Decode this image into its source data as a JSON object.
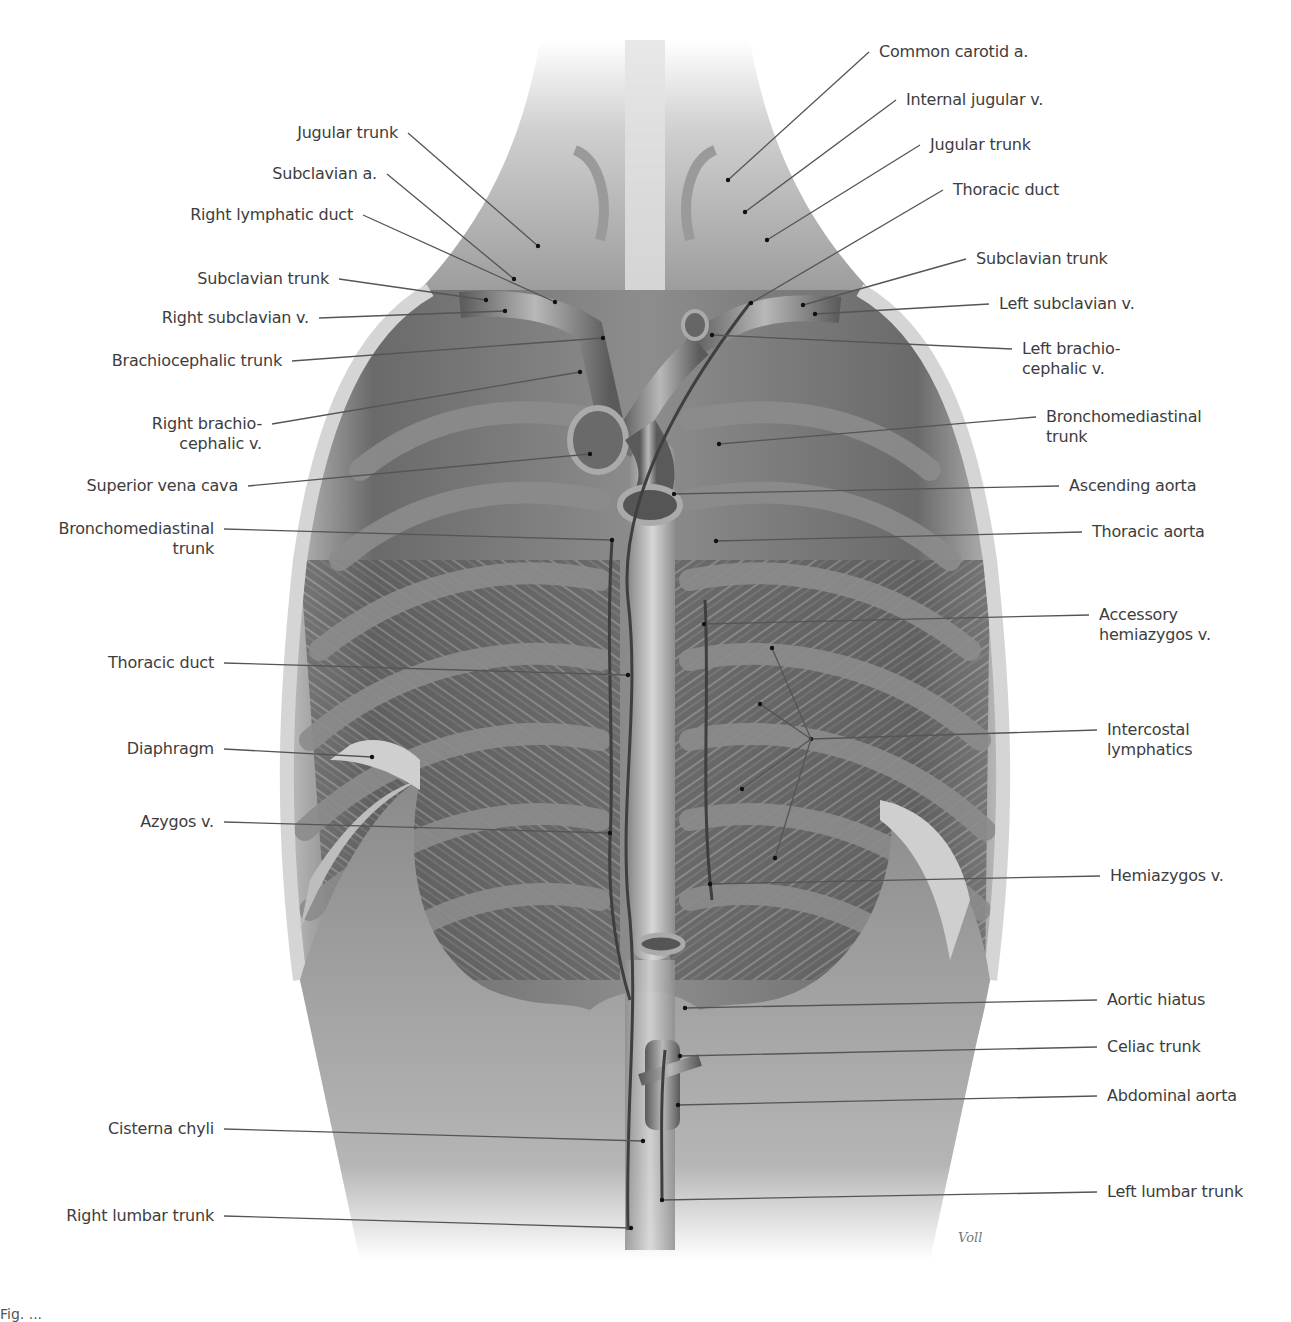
{
  "figure": {
    "signature": "Voll",
    "caption_partial": "Fig. ..."
  },
  "colors": {
    "background": "#ffffff",
    "label_text": "#3d3d3d",
    "leader_line": "#555555",
    "tissue_dark": "#4a4a4a",
    "tissue_mid": "#8a8a8a",
    "tissue_light": "#c8c8c8"
  },
  "labels_left": [
    {
      "id": "jugular-trunk-right",
      "text": "Jugular trunk",
      "x": 398,
      "y": 133,
      "anchor": "end",
      "tx": 538,
      "ty": 246
    },
    {
      "id": "subclavian-a",
      "text": "Subclavian a.",
      "x": 377,
      "y": 174,
      "anchor": "end",
      "tx": 514,
      "ty": 279
    },
    {
      "id": "right-lymphatic-duct",
      "text": "Right lymphatic duct",
      "x": 353,
      "y": 215,
      "anchor": "end",
      "tx": 555,
      "ty": 302
    },
    {
      "id": "subclavian-trunk-right",
      "text": "Subclavian trunk",
      "x": 329,
      "y": 279,
      "anchor": "end",
      "tx": 486,
      "ty": 300
    },
    {
      "id": "right-subclavian-v",
      "text": "Right subclavian v.",
      "x": 309,
      "y": 318,
      "anchor": "end",
      "tx": 505,
      "ty": 311
    },
    {
      "id": "brachiocephalic-trunk",
      "text": "Brachiocephalic trunk",
      "x": 282,
      "y": 361,
      "anchor": "end",
      "tx": 603,
      "ty": 338
    },
    {
      "id": "right-brachiocephalic-v",
      "text": "Right brachio-\ncephalic v.",
      "x": 262,
      "y": 424,
      "anchor": "end",
      "tx": 580,
      "ty": 372
    },
    {
      "id": "superior-vena-cava",
      "text": "Superior vena cava",
      "x": 238,
      "y": 486,
      "anchor": "end",
      "tx": 590,
      "ty": 454
    },
    {
      "id": "bronchomediastinal-trunk-right",
      "text": "Bronchomediastinal\ntrunk",
      "x": 214,
      "y": 529,
      "anchor": "end",
      "tx": 612,
      "ty": 540
    },
    {
      "id": "thoracic-duct-left-side",
      "text": "Thoracic duct",
      "x": 214,
      "y": 663,
      "anchor": "end",
      "tx": 628,
      "ty": 675
    },
    {
      "id": "diaphragm",
      "text": "Diaphragm",
      "x": 214,
      "y": 749,
      "anchor": "end",
      "tx": 372,
      "ty": 757
    },
    {
      "id": "azygos-v",
      "text": "Azygos v.",
      "x": 214,
      "y": 822,
      "anchor": "end",
      "tx": 610,
      "ty": 833
    },
    {
      "id": "cisterna-chyli",
      "text": "Cisterna chyli",
      "x": 214,
      "y": 1129,
      "anchor": "end",
      "tx": 643,
      "ty": 1141
    },
    {
      "id": "right-lumbar-trunk",
      "text": "Right lumbar trunk",
      "x": 214,
      "y": 1216,
      "anchor": "end",
      "tx": 631,
      "ty": 1228
    }
  ],
  "labels_right": [
    {
      "id": "common-carotid-a",
      "text": "Common carotid a.",
      "x": 879,
      "y": 52,
      "tx": 728,
      "ty": 180
    },
    {
      "id": "internal-jugular-v",
      "text": "Internal jugular v.",
      "x": 906,
      "y": 100,
      "tx": 745,
      "ty": 212
    },
    {
      "id": "jugular-trunk-left",
      "text": "Jugular trunk",
      "x": 930,
      "y": 145,
      "tx": 767,
      "ty": 240
    },
    {
      "id": "thoracic-duct-top",
      "text": "Thoracic duct",
      "x": 953,
      "y": 190,
      "tx": 751,
      "ty": 303
    },
    {
      "id": "subclavian-trunk-left",
      "text": "Subclavian trunk",
      "x": 976,
      "y": 259,
      "tx": 803,
      "ty": 305
    },
    {
      "id": "left-subclavian-v",
      "text": "Left subclavian v.",
      "x": 999,
      "y": 304,
      "tx": 815,
      "ty": 314
    },
    {
      "id": "left-brachiocephalic-v",
      "text": "Left brachio-\ncephalic v.",
      "x": 1022,
      "y": 349,
      "tx": 712,
      "ty": 335
    },
    {
      "id": "bronchomediastinal-trunk-left",
      "text": "Bronchomediastinal\ntrunk",
      "x": 1046,
      "y": 417,
      "tx": 719,
      "ty": 444
    },
    {
      "id": "ascending-aorta",
      "text": "Ascending aorta",
      "x": 1069,
      "y": 486,
      "tx": 674,
      "ty": 494
    },
    {
      "id": "thoracic-aorta",
      "text": "Thoracic aorta",
      "x": 1092,
      "y": 532,
      "tx": 716,
      "ty": 541
    },
    {
      "id": "accessory-hemiazygos-v",
      "text": "Accessory\nhemiazygos v.",
      "x": 1099,
      "y": 615,
      "tx": 704,
      "ty": 624
    },
    {
      "id": "intercostal-lymphatics",
      "text": "Intercostal\nlymphatics",
      "x": 1107,
      "y": 730,
      "tx": 811,
      "ty": 739
    },
    {
      "id": "hemiazygos-v",
      "text": "Hemiazygos v.",
      "x": 1110,
      "y": 876,
      "tx": 710,
      "ty": 884
    },
    {
      "id": "aortic-hiatus",
      "text": "Aortic hiatus",
      "x": 1107,
      "y": 1000,
      "tx": 685,
      "ty": 1008
    },
    {
      "id": "celiac-trunk",
      "text": "Celiac trunk",
      "x": 1107,
      "y": 1047,
      "tx": 680,
      "ty": 1056
    },
    {
      "id": "abdominal-aorta",
      "text": "Abdominal aorta",
      "x": 1107,
      "y": 1096,
      "tx": 678,
      "ty": 1105
    },
    {
      "id": "left-lumbar-trunk",
      "text": "Left lumbar trunk",
      "x": 1107,
      "y": 1192,
      "tx": 662,
      "ty": 1200
    }
  ],
  "intercostal_fan_targets": [
    [
      772,
      648
    ],
    [
      760,
      704
    ],
    [
      742,
      789
    ],
    [
      775,
      858
    ]
  ]
}
